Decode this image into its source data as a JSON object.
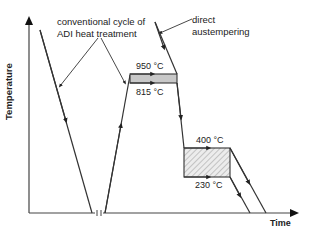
{
  "figure": {
    "axes": {
      "y_label": "Temperature",
      "x_label": "Time"
    },
    "annotations": {
      "conventional": [
        "conventional cycle of",
        "ADI heat treatment"
      ],
      "direct": [
        "direct",
        "austempering"
      ]
    },
    "temperatures": {
      "t950": "950 °C",
      "t815": "815 °C",
      "t400": "400 °C",
      "t230": "230 °C"
    },
    "colors": {
      "line": "#333333",
      "austenitize_fill": "#c8c8c8",
      "hatch": "#999999"
    }
  }
}
